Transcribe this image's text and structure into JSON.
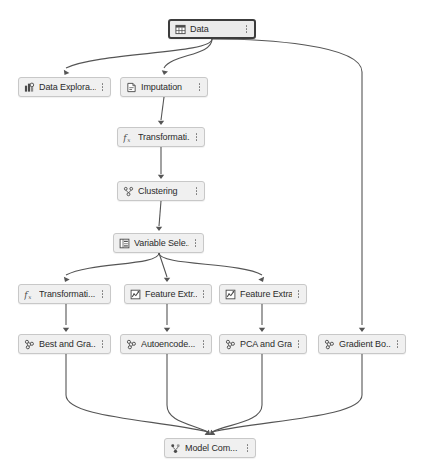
{
  "canvas": {
    "background": "#ffffff",
    "edge_color": "#555555",
    "node_fill": "#f0f0f0",
    "node_border": "#c8c8c8",
    "selected_border": "#3c3c3c",
    "width": 422,
    "height": 475
  },
  "nodes": [
    {
      "id": "data",
      "label": "Data",
      "icon": "table-grid-icon",
      "x": 168,
      "y": 19,
      "w": 88,
      "selected": true
    },
    {
      "id": "dataexp",
      "label": "Data Explora...",
      "icon": "data-exploration-icon",
      "x": 18,
      "y": 77,
      "w": 93,
      "selected": false
    },
    {
      "id": "imputation",
      "label": "Imputation",
      "icon": "imputation-icon",
      "x": 120,
      "y": 77,
      "w": 88,
      "selected": false
    },
    {
      "id": "transform1",
      "label": "Transformati...",
      "icon": "function-fx-icon",
      "x": 117,
      "y": 127,
      "w": 88,
      "selected": false
    },
    {
      "id": "clustering",
      "label": "Clustering",
      "icon": "clustering-icon",
      "x": 117,
      "y": 181,
      "w": 88,
      "selected": false
    },
    {
      "id": "varsel",
      "label": "Variable Sele...",
      "icon": "variable-selection-icon",
      "x": 113,
      "y": 233,
      "w": 91,
      "selected": false
    },
    {
      "id": "transform2",
      "label": "Transformati...",
      "icon": "function-fx-icon",
      "x": 18,
      "y": 284,
      "w": 93,
      "selected": false
    },
    {
      "id": "featext1",
      "label": "Feature Extr...",
      "icon": "feature-extraction-icon",
      "x": 124,
      "y": 284,
      "w": 88,
      "selected": false
    },
    {
      "id": "featext2",
      "label": "Feature Extra...",
      "icon": "feature-extraction-icon",
      "x": 219,
      "y": 284,
      "w": 88,
      "selected": false
    },
    {
      "id": "bestgrad",
      "label": "Best and Gra...",
      "icon": "model-icon",
      "x": 18,
      "y": 334,
      "w": 93,
      "selected": false
    },
    {
      "id": "autoenc",
      "label": "Autoencode...",
      "icon": "model-icon",
      "x": 120,
      "y": 334,
      "w": 92,
      "selected": false
    },
    {
      "id": "pcagrad",
      "label": "PCA and Gra...",
      "icon": "model-icon",
      "x": 219,
      "y": 334,
      "w": 88,
      "selected": false
    },
    {
      "id": "gradboost",
      "label": "Gradient Bo...",
      "icon": "model-icon",
      "x": 318,
      "y": 334,
      "w": 88,
      "selected": false
    },
    {
      "id": "modelcomp",
      "label": "Model Com...",
      "icon": "model-comparison-icon",
      "x": 164,
      "y": 438,
      "w": 92,
      "selected": false
    }
  ],
  "edges": [
    {
      "from": "data",
      "to": "dataexp",
      "path": "M 212 39 C 212 54, 100 52, 66 68",
      "arrow": {
        "x": 64.5,
        "y": 75,
        "angle": 120
      }
    },
    {
      "from": "data",
      "to": "imputation",
      "path": "M 212 39 C 212 56, 172 54, 164 68",
      "arrow": {
        "x": 164,
        "y": 75,
        "angle": 102
      }
    },
    {
      "from": "data",
      "to": "gradboost",
      "path": "M 212 39 C 260 39, 362 44, 362 72 L 362 325",
      "arrow": {
        "x": 362,
        "y": 332,
        "angle": 90
      }
    },
    {
      "from": "imputation",
      "to": "transform1",
      "path": "M 164 97 L 161 120",
      "arrow": {
        "x": 161,
        "y": 125,
        "angle": 90
      }
    },
    {
      "from": "transform1",
      "to": "clustering",
      "path": "M 161 147 L 161 174",
      "arrow": {
        "x": 161,
        "y": 179,
        "angle": 90
      }
    },
    {
      "from": "clustering",
      "to": "varsel",
      "path": "M 161 201 L 159 226",
      "arrow": {
        "x": 159,
        "y": 231,
        "angle": 90
      }
    },
    {
      "from": "varsel",
      "to": "transform2",
      "path": "M 159 253 C 159 266, 90 262, 66 275",
      "arrow": {
        "x": 65,
        "y": 282,
        "angle": 115
      }
    },
    {
      "from": "varsel",
      "to": "featext1",
      "path": "M 159 253 L 167 277",
      "arrow": {
        "x": 167,
        "y": 282,
        "angle": 90
      }
    },
    {
      "from": "varsel",
      "to": "featext2",
      "path": "M 159 253 C 159 266, 240 262, 262 275",
      "arrow": {
        "x": 263,
        "y": 282,
        "angle": 65
      }
    },
    {
      "from": "transform2",
      "to": "bestgrad",
      "path": "M 66 304 L 66 325",
      "arrow": {
        "x": 66,
        "y": 332,
        "angle": 90
      }
    },
    {
      "from": "featext1",
      "to": "autoenc",
      "path": "M 167 304 L 167 325",
      "arrow": {
        "x": 167,
        "y": 332,
        "angle": 90
      }
    },
    {
      "from": "featext2",
      "to": "pcagrad",
      "path": "M 262 304 L 262 325",
      "arrow": {
        "x": 262,
        "y": 332,
        "angle": 90
      }
    },
    {
      "from": "bestgrad",
      "to": "modelcomp",
      "path": "M 66 354 L 66 395 C 66 418, 160 420, 208 432",
      "arrow": {
        "x": 210,
        "y": 435,
        "angle": 40
      }
    },
    {
      "from": "autoenc",
      "to": "modelcomp",
      "path": "M 167 354 L 167 405 C 167 422, 192 424, 208 432",
      "arrow": {
        "x": 210,
        "y": 435,
        "angle": 40
      }
    },
    {
      "from": "pcagrad",
      "to": "modelcomp",
      "path": "M 262 354 L 262 405 C 262 422, 228 424, 212 432",
      "arrow": {
        "x": 210,
        "y": 435,
        "angle": 140
      }
    },
    {
      "from": "gradboost",
      "to": "modelcomp",
      "path": "M 362 354 L 362 395 C 362 418, 262 420, 212 432",
      "arrow": {
        "x": 210,
        "y": 435,
        "angle": 140
      }
    }
  ]
}
